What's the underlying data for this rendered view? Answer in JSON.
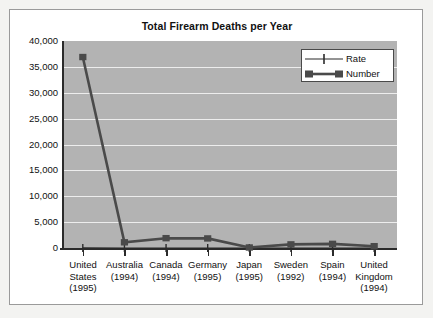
{
  "card": {
    "title": "Total Firearm Deaths per Year"
  },
  "legend": {
    "position": "top-right",
    "items": [
      {
        "label": "Rate",
        "key": "rate-line-plus-marker"
      },
      {
        "label": "Number",
        "key": "number-line-square-marker"
      }
    ]
  },
  "axes": {
    "y_ticks": [
      "40,000",
      "35,000",
      "30,000",
      "25,000",
      "20,000",
      "15,000",
      "10,000",
      "5,000",
      "0"
    ],
    "x_labels": [
      [
        "United",
        "States",
        "(1995)"
      ],
      [
        "Australia",
        "(1994)"
      ],
      [
        "Canada",
        "(1994)"
      ],
      [
        "Germany",
        "(1995)"
      ],
      [
        "Japan",
        "(1995)"
      ],
      [
        "Sweden",
        "(1992)"
      ],
      [
        "Spain",
        "(1994)"
      ],
      [
        "United",
        "Kingdom",
        "(1994)"
      ]
    ]
  },
  "colors": {
    "plot_background": "#b3b3b3",
    "gridline": "#ededed",
    "axis": "#2b2b2b",
    "series_number": "#4a4a4a",
    "series_rate": "#2b2b2b",
    "card_background": "#ffffff",
    "page_background": "#f3f3f1"
  },
  "chart_data": {
    "type": "line",
    "title": "Total Firearm Deaths per Year",
    "xlabel": "",
    "ylabel": "",
    "ylim": [
      0,
      40000
    ],
    "ytick_values": [
      0,
      5000,
      10000,
      15000,
      20000,
      25000,
      30000,
      35000,
      40000
    ],
    "grid": true,
    "legend_position": "top-right",
    "categories": [
      "United States (1995)",
      "Australia (1994)",
      "Canada (1994)",
      "Germany (1995)",
      "Japan (1995)",
      "Sweden (1992)",
      "Spain (1994)",
      "United Kingdom (1994)"
    ],
    "series": [
      {
        "name": "Number",
        "marker": "square",
        "values": [
          36900,
          1100,
          1900,
          1850,
          100,
          700,
          800,
          350
        ]
      },
      {
        "name": "Rate",
        "marker": "plus",
        "values": [
          14,
          3,
          5,
          2,
          1,
          2,
          1,
          1
        ]
      }
    ]
  }
}
